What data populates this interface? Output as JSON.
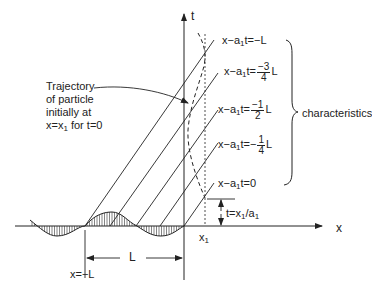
{
  "axes": {
    "x_label": "x",
    "t_label": "t",
    "x1_label": "x",
    "x1_sub": "1"
  },
  "characteristics": {
    "group_label": "characteristics",
    "lines": [
      {
        "prefix": "x−a",
        "sub": "1",
        "mid": "t=",
        "value": "−L"
      },
      {
        "prefix": "x−a",
        "sub": "1",
        "mid": "t=",
        "frac_num": "−3",
        "frac_den": "4",
        "suffix": "L"
      },
      {
        "prefix": "x−a",
        "sub": "1",
        "mid": "t=",
        "frac_num": "−1",
        "frac_den": "2",
        "suffix": "L"
      },
      {
        "prefix": "x−a",
        "sub": "1",
        "mid": "t=−",
        "frac_num": "1",
        "frac_den": "4",
        "suffix": "L"
      },
      {
        "prefix": "x−a",
        "sub": "1",
        "mid": "t=0",
        "value": ""
      }
    ]
  },
  "annotation": {
    "lines": [
      "Trajectory",
      "of particle",
      "initially at"
    ],
    "last_prefix": "x=x",
    "last_sub": "1",
    "last_suffix": " for t=0"
  },
  "time_marker": {
    "prefix": "t=x",
    "sub1": "1",
    "mid": "/a",
    "sub2": "1"
  },
  "dimension": {
    "span_label": "L",
    "start_label": "x=−L"
  }
}
